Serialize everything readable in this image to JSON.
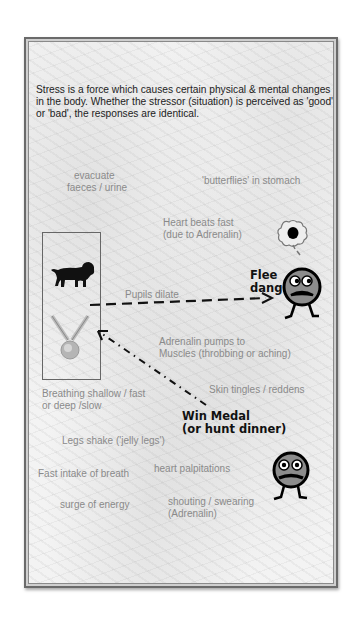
{
  "intro_text": "Stress is a force which causes certain physical & mental changes in the body. Whether the stressor (situation) is perceived as 'good' or 'bad', the responses are identical.",
  "labels": {
    "evacuate": "evacuate",
    "evacuate2": "faeces / urine",
    "butterflies": "'butterflies' in stomach",
    "heart1": "Heart beats fast",
    "heart2": "(due to Adrenalin)",
    "pupils": "Pupils dilate",
    "adrenalin1": "Adrenalin pumps to",
    "adrenalin2": "Muscles (throbbing or aching)",
    "skin": "Skin tingles / reddens",
    "breathing1": "Breathing shallow / fast",
    "breathing2": "or deep /slow",
    "legs": "Legs shake ('jelly legs')",
    "fast_intake": "Fast intake of breath",
    "palpitations": "heart palpitations",
    "surge": "surge of energy",
    "shouting1": "shouting / swearing",
    "shouting2": "(Adrenalin)"
  },
  "outcomes": {
    "flee1": "Flee",
    "flee2": "danger",
    "win1": "Win Medal",
    "win2": "(or hunt dinner)"
  },
  "icons": [
    "lion-icon",
    "medal-icon",
    "scared-face-icon",
    "thought-bubble-icon",
    "worried-face-icon"
  ],
  "colors": {
    "text": "#222222",
    "label": "#8a8a8a",
    "arrow": "#111111",
    "face": "#8c8c8c"
  }
}
